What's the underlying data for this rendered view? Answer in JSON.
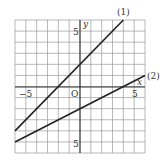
{
  "chart_data": {
    "type": "line",
    "title": "",
    "xlabel": "x",
    "ylabel": "y",
    "origin_label": "O",
    "xlim": [
      -6,
      6
    ],
    "ylim": [
      -6,
      6
    ],
    "grid": true,
    "x_tick_labels": [
      {
        "value": -5,
        "label": "−5"
      },
      {
        "value": 5,
        "label": "5"
      }
    ],
    "y_tick_labels": [
      {
        "value": 5,
        "label": "5"
      },
      {
        "value": -5,
        "label": "5"
      }
    ],
    "series": [
      {
        "name": "(1)",
        "equation": "y = x + 2",
        "x": [
          -6,
          4
        ],
        "y": [
          -4,
          6
        ]
      },
      {
        "name": "(2)",
        "equation": "y = x/2 - 2",
        "x": [
          -6,
          6
        ],
        "y": [
          -5,
          1
        ]
      }
    ]
  },
  "labels": {
    "line1": "(1)",
    "line2": "(2)",
    "x_axis": "x",
    "y_axis": "y",
    "origin": "O",
    "x_neg5": "−5",
    "x_pos5": "5",
    "y_pos5": "5",
    "y_neg5": "5"
  }
}
